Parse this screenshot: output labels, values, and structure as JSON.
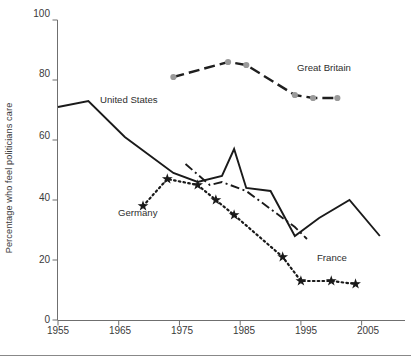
{
  "chart_data": {
    "type": "line",
    "title": "",
    "xlabel": "",
    "ylabel": "Percentage who feel politicians care",
    "xlim": [
      1955,
      2010
    ],
    "ylim": [
      0,
      100
    ],
    "xticks": [
      1955,
      1965,
      1975,
      1985,
      1995,
      2005
    ],
    "yticks": [
      0,
      20,
      40,
      60,
      80,
      100
    ],
    "grid": false,
    "legend_position": "inline-annotations",
    "series": [
      {
        "name": "United States",
        "style": "solid",
        "color": "#1a1a1a",
        "marker": "none",
        "points": [
          [
            1955,
            71
          ],
          [
            1960,
            73
          ],
          [
            1966,
            61
          ],
          [
            1974,
            49
          ],
          [
            1978,
            46
          ],
          [
            1982,
            48
          ],
          [
            1984,
            57
          ],
          [
            1986,
            44
          ],
          [
            1990,
            43
          ],
          [
            1994,
            28
          ],
          [
            1998,
            34
          ],
          [
            2003,
            40
          ],
          [
            2008,
            28
          ]
        ]
      },
      {
        "name": "Great Britain",
        "style": "dashed",
        "color": "#1f1f1f",
        "marker": "circle-gray",
        "marker_color": "#9a9a9a",
        "points": [
          [
            1974,
            81
          ],
          [
            1983,
            86
          ],
          [
            1986,
            85
          ],
          [
            1994,
            75
          ],
          [
            1997,
            74
          ],
          [
            2001,
            74
          ]
        ]
      },
      {
        "name": "Germany",
        "style": "dash-dot",
        "color": "#1a1a1a",
        "marker": "none",
        "points": [
          [
            1976,
            52
          ],
          [
            1980,
            45
          ],
          [
            1982,
            46
          ],
          [
            1986,
            43
          ],
          [
            1990,
            37
          ],
          [
            1994,
            31
          ],
          [
            1996,
            27
          ]
        ]
      },
      {
        "name": "France",
        "style": "dotted",
        "color": "#1a1a1a",
        "marker": "star",
        "points": [
          [
            1969,
            38
          ],
          [
            1973,
            47
          ],
          [
            1978,
            45
          ],
          [
            1981,
            40
          ],
          [
            1984,
            35
          ],
          [
            1992,
            21
          ],
          [
            1995,
            13
          ],
          [
            2000,
            13
          ],
          [
            2004,
            12
          ]
        ]
      }
    ],
    "annotations": [
      {
        "text": "United States",
        "x": 1971,
        "y": 71
      },
      {
        "text": "Great Britain",
        "x": 1995,
        "y": 79
      },
      {
        "text": "Germany",
        "x": 1967,
        "y": 31
      },
      {
        "text": "France",
        "x": 1998,
        "y": 22
      }
    ]
  },
  "axis": {
    "y_tick_labels": [
      "100",
      "80",
      "60",
      "40",
      "20",
      "0"
    ],
    "x_tick_labels": [
      "1955",
      "1965",
      "1975",
      "1985",
      "1995",
      "2005"
    ]
  },
  "labels": {
    "ylabel": "Percentage who feel politicians care",
    "united_states": "United States",
    "great_britain": "Great Britain",
    "germany": "Germany",
    "france": "France"
  }
}
